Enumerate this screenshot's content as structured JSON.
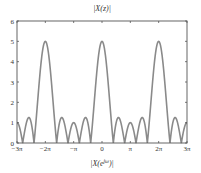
{
  "chart_data": {
    "type": "line",
    "title": "|X(z)|",
    "xlabel": "|X(e^{jω})|",
    "xlabel_main": "|X(e",
    "xlabel_sup": "jω",
    "xlabel_tail": ")|",
    "ylabel": "",
    "xlim": [
      -9.4248,
      9.4248
    ],
    "ylim": [
      0,
      6
    ],
    "x_ticks": [
      -9.4248,
      -6.2832,
      -3.1416,
      0,
      3.1416,
      6.2832,
      9.4248
    ],
    "x_tick_labels": [
      "−3π",
      "−2π",
      "−π",
      "0",
      "π",
      "2π",
      "3π"
    ],
    "y_ticks": [
      0,
      1,
      2,
      3,
      4,
      5,
      6
    ],
    "y_tick_labels": [
      "0",
      "1",
      "2",
      "3",
      "4",
      "5",
      "6"
    ],
    "grid": false,
    "legend": null,
    "series": [
      {
        "name": "|X(e^{jω})|",
        "formula": "|sin(5ω/2) / sin(ω/2)|",
        "color": "#8a8a8a",
        "peaks": [
          {
            "x": -6.2832,
            "y": 5
          },
          {
            "x": 0,
            "y": 5
          },
          {
            "x": 6.2832,
            "y": 5
          }
        ],
        "zeros_per_period": 4,
        "sidelobe_heights": [
          1.24,
          1.0,
          1.24
        ],
        "endpoint_values": [
          {
            "x": -9.4248,
            "y": 1
          },
          {
            "x": 9.4248,
            "y": 1
          }
        ]
      }
    ]
  },
  "colors": {
    "curve": "#8a8a8a",
    "axes": "#555555",
    "text": "#333333",
    "background": "#ffffff"
  }
}
